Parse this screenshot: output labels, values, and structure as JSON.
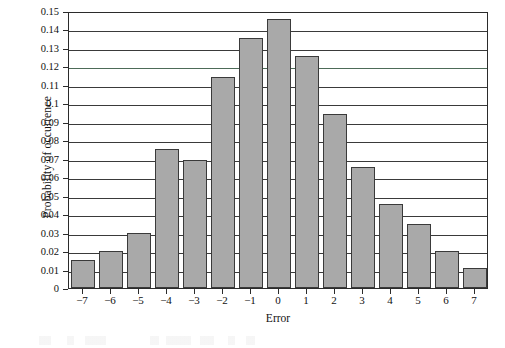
{
  "chart_data": {
    "type": "bar",
    "title": "",
    "xlabel": "Error",
    "ylabel": "Probability of occurrence",
    "categories": [
      "−7",
      "−6",
      "−5",
      "−4",
      "−3",
      "−2",
      "−1",
      "0",
      "1",
      "2",
      "3",
      "4",
      "5",
      "6",
      "7"
    ],
    "values": [
      0.015,
      0.02,
      0.03,
      0.0755,
      0.0695,
      0.1145,
      0.1355,
      0.1455,
      0.1255,
      0.0945,
      0.0655,
      0.0455,
      0.0345,
      0.02,
      0.011
    ],
    "ylim": [
      0,
      0.15
    ],
    "ytick_labels": [
      "0.15",
      "0.14",
      "0.13",
      "0.12",
      "0.11",
      "0.1",
      "0.09",
      "0.08",
      "0.07",
      "0.06",
      "0.05",
      "0.04",
      "0.03",
      "0.02",
      "0.01",
      "0"
    ],
    "ytick_values": [
      0.15,
      0.14,
      0.13,
      0.12,
      0.11,
      0.1,
      0.09,
      0.08,
      0.07,
      0.06,
      0.05,
      0.04,
      0.03,
      0.02,
      0.01,
      0
    ],
    "grid": true,
    "legend": null,
    "bar_fill_color": "#a9a9a9",
    "bar_edge_color": "#3a3a3a",
    "axis_color": "#2b2b2b",
    "background_color": "#ffffff"
  }
}
